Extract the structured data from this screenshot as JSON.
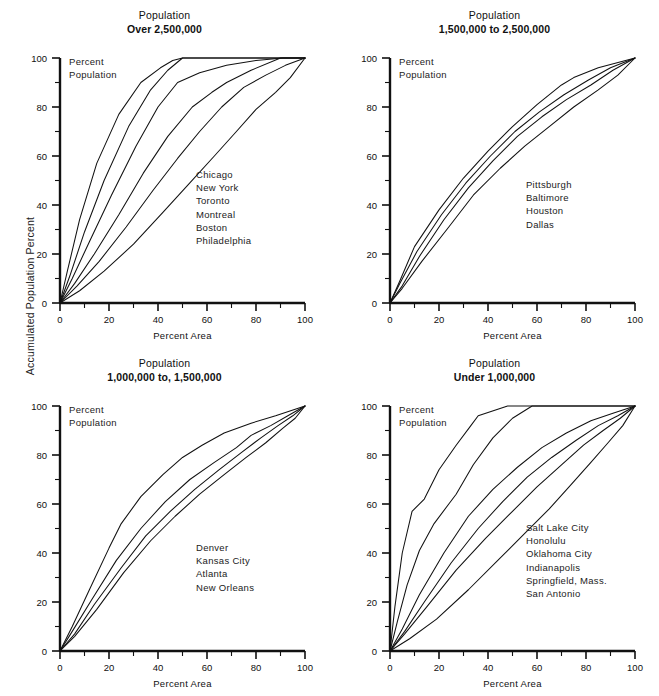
{
  "figure": {
    "y_axis_label": "Accumulated Population Percent",
    "background": "#ffffff",
    "line_color": "#111111"
  },
  "chart_data": [
    {
      "id": "over-2500000",
      "type": "line",
      "position": "top-left",
      "title_line1": "Population",
      "title_line2": "Over 2,500,000",
      "inner_note_line1": "Percent",
      "inner_note_line2": "Population",
      "xlabel": "Percent Area",
      "ylabel": "Accumulated Population Percent",
      "xlim": [
        0,
        100
      ],
      "ylim": [
        0,
        100
      ],
      "xticks": [
        0,
        20,
        40,
        60,
        80,
        100
      ],
      "yticks": [
        0,
        20,
        40,
        60,
        80,
        100
      ],
      "minor_tick_interval": 10,
      "grid": false,
      "legend_position": "inside-right",
      "legend_entries": [
        "Chicago",
        "New York",
        "Toronto",
        "Montreal",
        "Boston",
        "Philadelphia"
      ],
      "series": [
        {
          "name": "Chicago",
          "x": [
            0,
            3,
            8,
            15,
            24,
            33,
            41,
            46,
            50,
            100
          ],
          "y": [
            0,
            13,
            34,
            57,
            77,
            90,
            96,
            99,
            100,
            100
          ]
        },
        {
          "name": "New York",
          "x": [
            0,
            4,
            10,
            18,
            28,
            37,
            44,
            50,
            100
          ],
          "y": [
            0,
            11,
            29,
            50,
            72,
            87,
            95,
            100,
            100
          ]
        },
        {
          "name": "Toronto",
          "x": [
            0,
            5,
            12,
            21,
            31,
            40,
            48,
            57,
            68,
            80,
            91,
            100
          ],
          "y": [
            0,
            10,
            25,
            44,
            64,
            80,
            90,
            94,
            97,
            99,
            100,
            100
          ]
        },
        {
          "name": "Montreal",
          "x": [
            0,
            6,
            14,
            24,
            34,
            44,
            54,
            62,
            68,
            78,
            90,
            100
          ],
          "y": [
            0,
            8,
            20,
            36,
            53,
            68,
            80,
            86,
            90,
            95,
            100,
            100
          ]
        },
        {
          "name": "Boston",
          "x": [
            0,
            7,
            16,
            27,
            38,
            48,
            57,
            66,
            75,
            84,
            92,
            100
          ],
          "y": [
            0,
            7,
            17,
            31,
            46,
            59,
            70,
            80,
            88,
            93,
            97,
            100
          ]
        },
        {
          "name": "Philadelphia",
          "x": [
            0,
            8,
            18,
            30,
            42,
            53,
            63,
            72,
            80,
            88,
            94,
            100
          ],
          "y": [
            0,
            5,
            13,
            24,
            37,
            49,
            60,
            70,
            79,
            86,
            92,
            100
          ]
        }
      ]
    },
    {
      "id": "1500000-to-2500000",
      "type": "line",
      "position": "top-right",
      "title_line1": "Population",
      "title_line2": "1,500,000 to 2,500,000",
      "inner_note_line1": "Percent",
      "inner_note_line2": "Population",
      "xlabel": "Percent Area",
      "ylabel": "Accumulated Population Percent",
      "xlim": [
        0,
        100
      ],
      "ylim": [
        0,
        100
      ],
      "xticks": [
        0,
        20,
        40,
        60,
        80,
        100
      ],
      "yticks": [
        0,
        20,
        40,
        60,
        80,
        100
      ],
      "minor_tick_interval": 10,
      "grid": false,
      "legend_position": "inside-right",
      "legend_entries": [
        "Pittsburgh",
        "Baltimore",
        "Houston",
        "Dallas"
      ],
      "series": [
        {
          "name": "Pittsburgh",
          "x": [
            0,
            4,
            10,
            20,
            30,
            40,
            50,
            60,
            70,
            75,
            85,
            100
          ],
          "y": [
            0,
            9,
            23,
            38,
            51,
            62,
            72,
            81,
            89,
            92,
            96,
            100
          ]
        },
        {
          "name": "Baltimore",
          "x": [
            0,
            4,
            11,
            21,
            31,
            41,
            51,
            61,
            71,
            81,
            90,
            100
          ],
          "y": [
            0,
            8,
            21,
            36,
            49,
            60,
            70,
            78,
            85,
            91,
            96,
            100
          ]
        },
        {
          "name": "Houston",
          "x": [
            0,
            5,
            12,
            22,
            32,
            42,
            52,
            62,
            72,
            82,
            91,
            100
          ],
          "y": [
            0,
            7,
            19,
            34,
            47,
            58,
            68,
            76,
            83,
            89,
            95,
            100
          ]
        },
        {
          "name": "Dallas",
          "x": [
            0,
            5,
            13,
            24,
            34,
            45,
            55,
            65,
            75,
            85,
            93,
            100
          ],
          "y": [
            0,
            6,
            17,
            31,
            44,
            55,
            64,
            72,
            80,
            87,
            93,
            100
          ]
        }
      ]
    },
    {
      "id": "1000000-to-1500000",
      "type": "line",
      "position": "bottom-left",
      "title_line1": "Population",
      "title_line2": "1,000,000 to, 1,500,000",
      "inner_note_line1": "Percent",
      "inner_note_line2": "Population",
      "xlabel": "Percent Area",
      "ylabel": "Accumulated Population Percent",
      "xlim": [
        0,
        100
      ],
      "ylim": [
        0,
        100
      ],
      "xticks": [
        0,
        20,
        40,
        60,
        80,
        100
      ],
      "yticks": [
        0,
        20,
        40,
        60,
        80,
        100
      ],
      "minor_tick_interval": 10,
      "grid": false,
      "legend_position": "inside-right",
      "legend_entries": [
        "Denver",
        "Kansas City",
        "Atlanta",
        "New Orleans"
      ],
      "series": [
        {
          "name": "Denver",
          "x": [
            0,
            5,
            12,
            20,
            25,
            33,
            42,
            50,
            58,
            67,
            78,
            88,
            100
          ],
          "y": [
            0,
            10,
            25,
            42,
            52,
            63,
            72,
            79,
            84,
            89,
            93,
            96,
            100
          ]
        },
        {
          "name": "Kansas City",
          "x": [
            0,
            5,
            13,
            23,
            33,
            43,
            53,
            63,
            72,
            78,
            86,
            93,
            100
          ],
          "y": [
            0,
            8,
            21,
            37,
            50,
            61,
            70,
            77,
            83,
            88,
            92,
            96,
            100
          ]
        },
        {
          "name": "Atlanta",
          "x": [
            0,
            6,
            14,
            25,
            35,
            45,
            55,
            65,
            74,
            82,
            89,
            95,
            100
          ],
          "y": [
            0,
            7,
            19,
            34,
            47,
            57,
            66,
            74,
            81,
            87,
            92,
            96,
            100
          ]
        },
        {
          "name": "New Orleans",
          "x": [
            0,
            6,
            15,
            26,
            37,
            47,
            57,
            67,
            76,
            84,
            91,
            96,
            100
          ],
          "y": [
            0,
            6,
            17,
            32,
            45,
            55,
            64,
            72,
            79,
            85,
            91,
            95,
            100
          ]
        }
      ]
    },
    {
      "id": "under-1000000",
      "type": "line",
      "position": "bottom-right",
      "title_line1": "Population",
      "title_line2": "Under 1,000,000",
      "inner_note_line1": "Percent",
      "inner_note_line2": "Population",
      "xlabel": "Percent Area",
      "ylabel": "Accumulated Population Percent",
      "xlim": [
        0,
        100
      ],
      "ylim": [
        0,
        100
      ],
      "xticks": [
        0,
        20,
        40,
        60,
        80,
        100
      ],
      "yticks": [
        0,
        20,
        40,
        60,
        80,
        100
      ],
      "minor_tick_interval": 10,
      "grid": false,
      "legend_position": "inside-right",
      "legend_entries": [
        "Salt Lake City",
        "Honolulu",
        "Oklahoma City",
        "Indianapolis",
        "Springfield, Mass.",
        "San Antonio"
      ],
      "series": [
        {
          "name": "Salt Lake City",
          "x": [
            0,
            2,
            5,
            9,
            14,
            20,
            27,
            33,
            36,
            48,
            100
          ],
          "y": [
            0,
            18,
            40,
            57,
            62,
            74,
            84,
            92,
            96,
            100,
            100
          ]
        },
        {
          "name": "Honolulu",
          "x": [
            0,
            3,
            7,
            12,
            18,
            24,
            27,
            34,
            42,
            50,
            58,
            100
          ],
          "y": [
            0,
            12,
            27,
            41,
            52,
            60,
            64,
            76,
            87,
            95,
            100,
            100
          ]
        },
        {
          "name": "Oklahoma City",
          "x": [
            0,
            5,
            12,
            22,
            32,
            42,
            52,
            62,
            72,
            82,
            91,
            100
          ],
          "y": [
            0,
            9,
            23,
            40,
            55,
            66,
            75,
            83,
            89,
            94,
            97,
            100
          ]
        },
        {
          "name": "Indianapolis",
          "x": [
            0,
            6,
            14,
            25,
            36,
            46,
            56,
            66,
            76,
            85,
            93,
            100
          ],
          "y": [
            0,
            8,
            20,
            36,
            50,
            61,
            71,
            79,
            86,
            92,
            96,
            100
          ]
        },
        {
          "name": "Springfield, Mass.",
          "x": [
            0,
            6,
            15,
            27,
            39,
            50,
            60,
            70,
            79,
            87,
            94,
            100
          ],
          "y": [
            0,
            7,
            18,
            33,
            46,
            57,
            67,
            76,
            84,
            90,
            95,
            100
          ]
        },
        {
          "name": "San Antonio",
          "x": [
            0,
            8,
            19,
            32,
            44,
            55,
            65,
            74,
            82,
            89,
            95,
            100
          ],
          "y": [
            0,
            5,
            13,
            25,
            37,
            48,
            58,
            68,
            77,
            85,
            92,
            100
          ]
        }
      ]
    }
  ]
}
